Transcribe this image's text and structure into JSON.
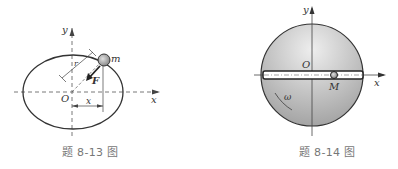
{
  "figures": [
    {
      "caption": "题 8-13 图",
      "labels": {
        "y": "y",
        "x_axis": "x",
        "origin": "O",
        "mass": "m",
        "force": "F",
        "radius": "r",
        "x_dim": "x"
      }
    },
    {
      "caption": "题 8-14 图",
      "labels": {
        "y": "y",
        "x_axis": "x",
        "origin": "O",
        "point": "M",
        "omega": "ω"
      }
    }
  ],
  "colors": {
    "line": "#333333",
    "sphere_light": "#e6e6e6",
    "sphere_dark": "#a8a8a8",
    "caption": "#777777"
  }
}
